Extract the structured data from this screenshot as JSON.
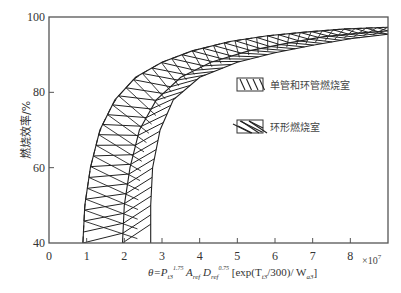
{
  "chart_data": {
    "type": "area",
    "title": "",
    "xlabel": "θ=P₃^1.75 A_ref D_ref^0.75 [exp(T₃/300)/W_a3]",
    "xlabel_parts": {
      "theta": "θ=P",
      "sub1": "t3",
      "sup1": "1.75",
      "a": " A",
      "sub2": "ref",
      "d": " D",
      "sub3": "ref",
      "sup3": "0.75",
      "rest": " [exp(T",
      "sub4": "t3",
      "rest2": "/300)/ W",
      "sub5": "a3",
      "end": "]"
    },
    "x_multiplier": "×10⁷",
    "x_multiplier_base": "×10",
    "x_multiplier_exp": "7",
    "ylabel": "燃烧效率/%",
    "xlim": [
      0,
      9
    ],
    "ylim": [
      40,
      100
    ],
    "xticks": [
      0,
      1,
      2,
      3,
      4,
      5,
      6,
      7,
      8
    ],
    "xtick_labels": [
      "0",
      "1",
      "2",
      "3",
      "4",
      "5",
      "6",
      "7",
      "8"
    ],
    "yticks": [
      40,
      60,
      80,
      100
    ],
    "ytick_labels": [
      "40",
      "60",
      "80",
      "100"
    ],
    "grid": false,
    "legend_position": "center-right",
    "series": [
      {
        "name": "单管和环管燃烧室",
        "hatch": "backslash-with-ticks",
        "lower_boundary": [
          [
            0.9,
            40
          ],
          [
            1.0,
            50
          ],
          [
            1.2,
            60
          ],
          [
            1.5,
            70
          ],
          [
            2.0,
            80
          ],
          [
            2.7,
            86
          ],
          [
            3.5,
            89
          ],
          [
            4.5,
            91.5
          ],
          [
            5.5,
            93
          ],
          [
            6.5,
            94.5
          ],
          [
            7.5,
            95.5
          ],
          [
            8.5,
            96.3
          ],
          [
            9.0,
            96.6
          ]
        ],
        "upper_boundary": [
          [
            0.9,
            40
          ],
          [
            1.0,
            50
          ],
          [
            1.2,
            60
          ],
          [
            1.5,
            70
          ],
          [
            2.0,
            80
          ],
          [
            2.7,
            86
          ],
          [
            3.5,
            89
          ],
          [
            4.5,
            91.5
          ],
          [
            5.5,
            93
          ],
          [
            6.5,
            94.5
          ],
          [
            7.5,
            95.5
          ],
          [
            8.5,
            96.3
          ],
          [
            9.0,
            96.6
          ]
        ]
      },
      {
        "name": "环形燃烧室",
        "hatch": "diagonal-crosshatch",
        "upper_boundary": [
          [
            1.35,
            40
          ],
          [
            1.45,
            50
          ],
          [
            1.65,
            60
          ],
          [
            2.0,
            70
          ],
          [
            2.5,
            78
          ],
          [
            3.2,
            84
          ],
          [
            4.0,
            88
          ],
          [
            5.0,
            90.5
          ],
          [
            6.0,
            92.5
          ],
          [
            7.0,
            94
          ],
          [
            8.0,
            95.2
          ],
          [
            9.0,
            96
          ]
        ],
        "lower_boundary": [
          [
            2.7,
            40
          ],
          [
            2.7,
            50
          ],
          [
            2.75,
            60
          ],
          [
            2.95,
            70
          ],
          [
            3.3,
            78
          ],
          [
            4.0,
            84
          ],
          [
            5.0,
            88
          ],
          [
            6.0,
            90.5
          ],
          [
            7.0,
            92.5
          ],
          [
            8.0,
            94.2
          ],
          [
            9.0,
            95.4
          ]
        ]
      }
    ],
    "envelope": {
      "outer": [
        [
          0.9,
          40
        ],
        [
          0.95,
          50
        ],
        [
          1.1,
          60
        ],
        [
          1.35,
          70
        ],
        [
          1.75,
          78
        ],
        [
          2.3,
          84
        ],
        [
          3.0,
          88
        ],
        [
          3.8,
          91
        ],
        [
          4.8,
          93.5
        ],
        [
          5.8,
          95
        ],
        [
          6.8,
          96
        ],
        [
          7.8,
          96.8
        ],
        [
          9.0,
          97.3
        ]
      ],
      "inner": [
        [
          2.7,
          40
        ],
        [
          2.7,
          50
        ],
        [
          2.75,
          60
        ],
        [
          2.95,
          70
        ],
        [
          3.3,
          78
        ],
        [
          4.0,
          84
        ],
        [
          5.0,
          88
        ],
        [
          6.0,
          90.5
        ],
        [
          7.0,
          92.5
        ],
        [
          8.0,
          94.2
        ],
        [
          9.0,
          95.4
        ]
      ],
      "middle": [
        [
          1.95,
          40
        ],
        [
          2.0,
          50
        ],
        [
          2.15,
          60
        ],
        [
          2.4,
          70
        ],
        [
          2.85,
          78
        ],
        [
          3.5,
          84
        ],
        [
          4.3,
          88
        ],
        [
          5.3,
          91
        ],
        [
          6.3,
          93
        ],
        [
          7.3,
          94.8
        ],
        [
          8.3,
          95.8
        ],
        [
          9.0,
          96.3
        ]
      ]
    }
  }
}
